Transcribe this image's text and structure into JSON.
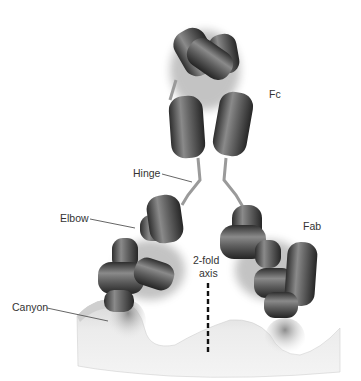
{
  "diagram": {
    "colors": {
      "background": "#ffffff",
      "domain_dark": "#3a3a3a",
      "domain_mid": "#6e6e6e",
      "domain_light": "#b8b8b8",
      "surface": "#e8e8e8",
      "surface_shadow": "#bdbdbd",
      "label_text": "#333333",
      "leader_line": "#555555",
      "axis_line": "#111111"
    },
    "labels": {
      "fc": "Fc",
      "hinge": "Hinge",
      "elbow": "Elbow",
      "fab": "Fab",
      "axis_line1": "2-fold",
      "axis_line2": "axis",
      "canyon": "Canyon"
    }
  }
}
